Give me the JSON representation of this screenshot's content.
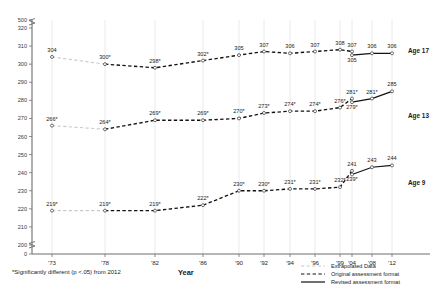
{
  "chart_data": {
    "type": "line",
    "title": "",
    "xlabel": "Year",
    "ylabel": "",
    "grid": true,
    "legend_position": "bottom-right",
    "categories": [
      "'73",
      "'78",
      "'82",
      "'86",
      "'90",
      "'92",
      "'94",
      "'96",
      "'99",
      "'04",
      "'08",
      "'12"
    ],
    "ylim": [
      200,
      320
    ],
    "yticks": [
      0,
      200,
      210,
      220,
      230,
      240,
      250,
      260,
      270,
      280,
      290,
      300,
      310,
      320,
      500
    ],
    "series": [
      {
        "name": "Age 17",
        "label": "Age 17",
        "original_values": [
          304,
          300,
          298,
          302,
          305,
          307,
          306,
          307,
          308,
          307,
          null,
          null
        ],
        "revised_values": [
          null,
          null,
          null,
          null,
          null,
          null,
          null,
          null,
          null,
          305,
          306,
          306
        ],
        "extrapolated_through": "'78",
        "original_labels": [
          "304",
          "300*",
          "298*",
          "302*",
          "305",
          "307",
          "306",
          "307",
          "308",
          "307",
          "",
          ""
        ],
        "revised_labels": [
          "",
          "",
          "",
          "",
          "",
          "",
          "",
          "",
          "",
          "305",
          "306",
          "306"
        ]
      },
      {
        "name": "Age 13",
        "label": "Age 13",
        "original_values": [
          266,
          264,
          269,
          269,
          270,
          273,
          274,
          274,
          276,
          281,
          null,
          null
        ],
        "revised_values": [
          null,
          null,
          null,
          null,
          null,
          null,
          null,
          null,
          null,
          279,
          281,
          285
        ],
        "extrapolated_through": "'78",
        "original_labels": [
          "266*",
          "264*",
          "269*",
          "269*",
          "270*",
          "273*",
          "274*",
          "274*",
          "276*",
          "281*",
          "",
          ""
        ],
        "revised_labels": [
          "",
          "",
          "",
          "",
          "",
          "",
          "",
          "",
          "",
          "279*",
          "281*",
          "285"
        ]
      },
      {
        "name": "Age 9",
        "label": "Age 9",
        "original_values": [
          219,
          219,
          219,
          222,
          230,
          230,
          231,
          231,
          232,
          241,
          null,
          null
        ],
        "revised_values": [
          null,
          null,
          null,
          null,
          null,
          null,
          null,
          null,
          null,
          239,
          243,
          244
        ],
        "extrapolated_through": "'78",
        "original_labels": [
          "219*",
          "219*",
          "219*",
          "222*",
          "230*",
          "230*",
          "231*",
          "231*",
          "232*",
          "241",
          "",
          ""
        ],
        "revised_labels": [
          "",
          "",
          "",
          "",
          "",
          "",
          "",
          "",
          "",
          "239*",
          "243",
          "244"
        ]
      }
    ]
  },
  "axes": {
    "x_title": "Year",
    "y_tick_labels": [
      "500",
      "320",
      "310",
      "300",
      "290",
      "280",
      "270",
      "260",
      "250",
      "240",
      "230",
      "220",
      "210",
      "200",
      "0"
    ],
    "x_tick_labels": [
      "'73",
      "'78",
      "'82",
      "'86",
      "'90",
      "'92",
      "'94",
      "'96",
      "'99",
      "'04",
      "'08",
      "'12"
    ]
  },
  "series_end_labels": {
    "age17": "Age 17",
    "age13": "Age 13",
    "age9": "Age 9"
  },
  "legend": {
    "items": [
      {
        "key": "extrapolated",
        "label": "Extrapolated Data",
        "style": "dashed-gray",
        "color": "#c9c9c9"
      },
      {
        "key": "original",
        "label": "Original assessment format",
        "style": "dashed-black",
        "color": "#111111"
      },
      {
        "key": "revised",
        "label": "Revised assessment format",
        "style": "solid-black",
        "color": "#111111"
      }
    ]
  },
  "footnote": {
    "text": "*Significantly different (p <.05) from 2012"
  },
  "point_labels": {
    "age17": {
      "73": "304",
      "78": "300*",
      "82": "298*",
      "86": "302*",
      "90": "305",
      "92": "307",
      "94": "306",
      "96": "307",
      "99": "308",
      "04_original": "307",
      "04_revised": "305",
      "08": "306",
      "12": "306"
    },
    "age13": {
      "73": "266*",
      "78": "264*",
      "82": "269*",
      "86": "269*",
      "90": "270*",
      "92": "273*",
      "94": "274*",
      "96": "274*",
      "99": "276*",
      "04_original": "281*",
      "04_revised": "279*",
      "08": "281*",
      "12": "285"
    },
    "age9": {
      "73": "219*",
      "78": "219*",
      "82": "219*",
      "86": "222*",
      "90": "230*",
      "92": "230*",
      "94": "231*",
      "96": "231*",
      "99": "232*",
      "04_original": "241",
      "04_revised": "239*",
      "08": "243",
      "12": "244"
    }
  }
}
